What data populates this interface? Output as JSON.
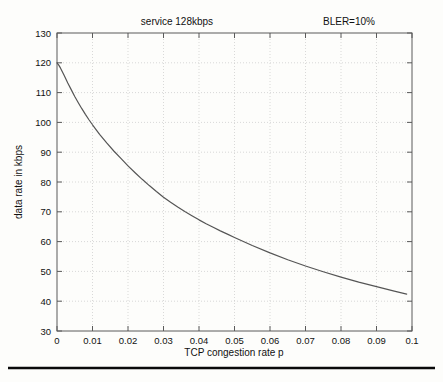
{
  "figure": {
    "background_color": "#fdfdfb",
    "bottom_rule": true
  },
  "titles": {
    "left": "service 128kbps",
    "right": "BLER=10%"
  },
  "chart_data": {
    "type": "line",
    "title": "service 128kbps          BLER=10%",
    "subtitle": "",
    "xlabel": "TCP congestion rate p",
    "ylabel": "data rate in kbps",
    "xlim": [
      0,
      0.1
    ],
    "ylim": [
      30,
      130
    ],
    "xticks": [
      0,
      0.01,
      0.02,
      0.03,
      0.04,
      0.05,
      0.06,
      0.07,
      0.08,
      0.09,
      0.1
    ],
    "xticklabels": [
      "0",
      "0.01",
      "0.02",
      "0.03",
      "0.04",
      "0.05",
      "0.06",
      "0.07",
      "0.08",
      "0.09",
      "0.1"
    ],
    "yticks": [
      30,
      40,
      50,
      60,
      70,
      80,
      90,
      100,
      110,
      120,
      130
    ],
    "yticklabels": [
      "30",
      "40",
      "50",
      "60",
      "70",
      "80",
      "90",
      "100",
      "110",
      "120",
      "130"
    ],
    "grid": true,
    "grid_style": "dotted",
    "legend": null,
    "legend_position": "none",
    "line_color": "#555555",
    "annotations": [
      {
        "text": "service 128kbps",
        "position": "top-center-left"
      },
      {
        "text": "BLER=10%",
        "position": "top-right"
      }
    ],
    "series": [
      {
        "name": "data rate",
        "x": [
          0.0,
          0.0005,
          0.001,
          0.002,
          0.003,
          0.004,
          0.005,
          0.006,
          0.007,
          0.008,
          0.009,
          0.01,
          0.012,
          0.014,
          0.016,
          0.018,
          0.02,
          0.022,
          0.024,
          0.026,
          0.028,
          0.03,
          0.032,
          0.034,
          0.036,
          0.038,
          0.04,
          0.042,
          0.044,
          0.046,
          0.048,
          0.05,
          0.055,
          0.06,
          0.065,
          0.07,
          0.075,
          0.08,
          0.085,
          0.09,
          0.095,
          0.0985
        ],
        "y": [
          120.0,
          119.2,
          118.2,
          115.8,
          113.3,
          111.0,
          108.7,
          106.6,
          104.6,
          102.7,
          100.9,
          99.2,
          96.0,
          93.1,
          90.4,
          87.9,
          85.4,
          83.1,
          80.9,
          78.8,
          76.8,
          74.9,
          73.2,
          71.6,
          70.1,
          68.7,
          67.3,
          66.0,
          64.8,
          63.6,
          62.5,
          61.4,
          58.7,
          56.2,
          53.9,
          51.8,
          49.9,
          48.1,
          46.4,
          44.9,
          43.4,
          42.4
        ]
      }
    ]
  }
}
